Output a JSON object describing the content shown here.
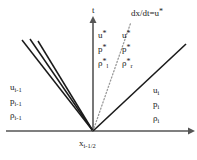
{
  "figure": {
    "axes": {
      "vertical_label": "t",
      "horizontal_label_base": "x",
      "horizontal_label_sub": "i-1/2",
      "axis_color": "#555555"
    },
    "annotations": {
      "contact_slope_label": "dx/dt=u",
      "contact_slope_star": "*"
    },
    "states": {
      "left": {
        "name": "left-state",
        "velocity_base": "u",
        "velocity_sub": "i-1",
        "pressure_base": "p",
        "pressure_sub": "i-1",
        "density_base": "ρ",
        "density_sub": "i-1"
      },
      "right": {
        "name": "right-state",
        "velocity_base": "u",
        "velocity_sub": "i",
        "pressure_base": "p",
        "pressure_sub": "i",
        "density_base": "ρ",
        "density_sub": "i"
      },
      "star_left": {
        "name": "star-left-state",
        "velocity_base": "u",
        "velocity_star": "*",
        "pressure_base": "p",
        "pressure_star": "*",
        "density_base": "ρ",
        "density_star": "*",
        "density_sub": "l"
      },
      "star_right": {
        "name": "star-right-state",
        "velocity_base": "u",
        "velocity_star": "*",
        "pressure_base": "p",
        "pressure_star": "*",
        "density_base": "ρ",
        "density_star": "*",
        "density_sub": "r"
      }
    },
    "waves": {
      "rarefaction_fan": {
        "style": "solid",
        "color": "#1a1a1a",
        "count": 3
      },
      "contact": {
        "style": "dotted",
        "color": "#999999"
      },
      "shock": {
        "style": "solid",
        "color": "#1a1a1a"
      }
    },
    "colors": {
      "background": "#ffffff",
      "ink": "#1a1a1a",
      "axis": "#555555",
      "dotted": "#999999"
    }
  }
}
